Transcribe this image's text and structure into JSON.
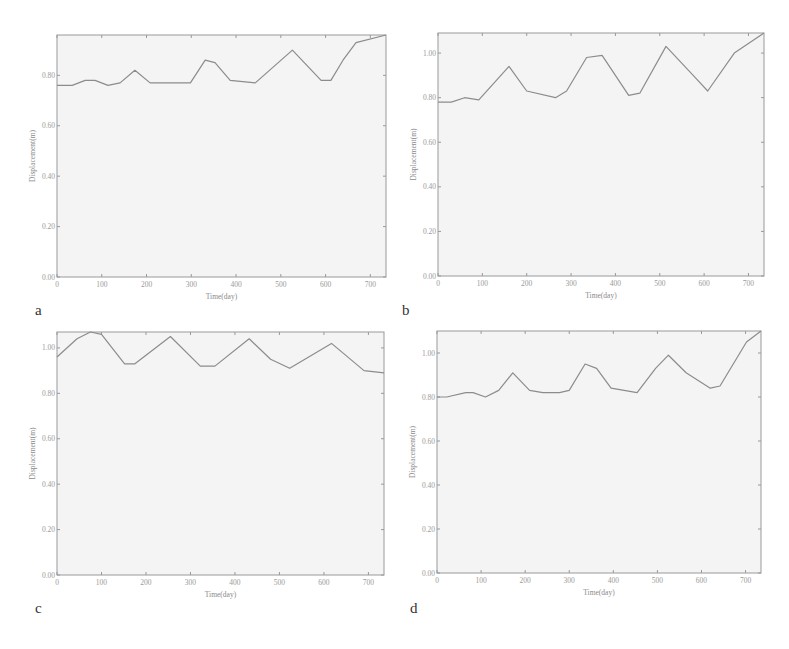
{
  "figure": {
    "panels": [
      "a",
      "b",
      "c",
      "d"
    ]
  },
  "chart_data": [
    {
      "id": "a",
      "type": "line",
      "title": "",
      "xlabel": "Time(day)",
      "ylabel": "Displacement(m)",
      "xlim": [
        0,
        735
      ],
      "ylim": [
        0.0,
        0.96
      ],
      "xticks": [
        0,
        100,
        200,
        300,
        400,
        500,
        600,
        700
      ],
      "yticks": [
        0.0,
        0.2,
        0.4,
        0.6,
        0.8
      ],
      "ytick_labels": [
        "0.00",
        "0.20",
        "0.40",
        "0.60",
        "0.80"
      ],
      "grid": false,
      "series": [
        {
          "name": "displacement",
          "x": [
            0,
            34,
            63,
            85,
            114,
            141,
            174,
            208,
            286,
            298,
            331,
            353,
            387,
            443,
            526,
            590,
            612,
            639,
            668,
            735
          ],
          "y": [
            0.76,
            0.76,
            0.78,
            0.78,
            0.76,
            0.77,
            0.82,
            0.77,
            0.77,
            0.77,
            0.86,
            0.85,
            0.78,
            0.77,
            0.9,
            0.78,
            0.78,
            0.86,
            0.93,
            0.96
          ]
        }
      ]
    },
    {
      "id": "b",
      "type": "line",
      "title": "",
      "xlabel": "Time(day)",
      "ylabel": "Displacement(m)",
      "xlim": [
        0,
        735
      ],
      "ylim": [
        0.0,
        1.09
      ],
      "xticks": [
        0,
        100,
        200,
        300,
        400,
        500,
        600,
        700
      ],
      "yticks": [
        0.0,
        0.2,
        0.4,
        0.6,
        0.8,
        1.0
      ],
      "ytick_labels": [
        "0.00",
        "0.20",
        "0.40",
        "0.60",
        "0.80",
        "1.00"
      ],
      "grid": false,
      "series": [
        {
          "name": "displacement",
          "x": [
            0,
            30,
            60,
            92,
            160,
            200,
            265,
            290,
            335,
            370,
            430,
            455,
            514,
            580,
            608,
            668,
            735
          ],
          "y": [
            0.78,
            0.78,
            0.8,
            0.79,
            0.94,
            0.83,
            0.8,
            0.83,
            0.98,
            0.99,
            0.81,
            0.82,
            1.03,
            0.89,
            0.83,
            1.0,
            1.09
          ]
        }
      ]
    },
    {
      "id": "c",
      "type": "line",
      "title": "",
      "xlabel": "Time(day)",
      "ylabel": "Displacement(m)",
      "xlim": [
        0,
        735
      ],
      "ylim": [
        0.0,
        1.07
      ],
      "xticks": [
        0,
        100,
        200,
        300,
        400,
        500,
        600,
        700
      ],
      "yticks": [
        0.0,
        0.2,
        0.4,
        0.6,
        0.8,
        1.0
      ],
      "ytick_labels": [
        "0.00",
        "0.20",
        "0.40",
        "0.60",
        "0.80",
        "1.00"
      ],
      "grid": false,
      "series": [
        {
          "name": "displacement",
          "x": [
            0,
            45,
            75,
            100,
            152,
            175,
            255,
            322,
            355,
            432,
            480,
            523,
            617,
            690,
            735
          ],
          "y": [
            0.96,
            1.04,
            1.07,
            1.06,
            0.93,
            0.93,
            1.05,
            0.92,
            0.92,
            1.04,
            0.95,
            0.91,
            1.02,
            0.9,
            0.89
          ]
        }
      ]
    },
    {
      "id": "d",
      "type": "line",
      "title": "",
      "xlabel": "Time(day)",
      "ylabel": "Displacement(m)",
      "xlim": [
        0,
        735
      ],
      "ylim": [
        0.0,
        1.1
      ],
      "xticks": [
        0,
        100,
        200,
        300,
        400,
        500,
        600,
        700
      ],
      "yticks": [
        0.0,
        0.2,
        0.4,
        0.6,
        0.8,
        1.0
      ],
      "ytick_labels": [
        "0.00",
        "0.20",
        "0.40",
        "0.60",
        "0.80",
        "1.00"
      ],
      "grid": false,
      "series": [
        {
          "name": "displacement",
          "x": [
            0,
            22,
            65,
            82,
            110,
            140,
            172,
            210,
            240,
            278,
            300,
            336,
            362,
            395,
            454,
            496,
            525,
            565,
            620,
            642,
            702,
            735
          ],
          "y": [
            0.8,
            0.8,
            0.82,
            0.82,
            0.8,
            0.83,
            0.91,
            0.83,
            0.82,
            0.82,
            0.83,
            0.95,
            0.93,
            0.84,
            0.82,
            0.93,
            0.99,
            0.91,
            0.84,
            0.85,
            1.05,
            1.1
          ]
        }
      ]
    }
  ]
}
